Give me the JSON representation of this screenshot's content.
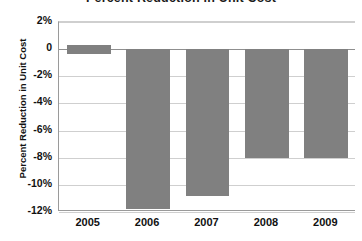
{
  "chart_data": {
    "type": "bar",
    "title": "Percent Reduction in Unit Cost",
    "xlabel": "",
    "ylabel": "Percent Reduction in Unit Cost",
    "categories": [
      "2005",
      "2006",
      "2007",
      "2008",
      "2009"
    ],
    "values": [
      0,
      -11.8,
      -10.8,
      -8.0,
      -8.0
    ],
    "ylim": [
      -12,
      2
    ],
    "ytick_labels": [
      "2%",
      "0",
      "-2%",
      "-4%",
      "-6%",
      "-8%",
      "-10%",
      "-12%"
    ],
    "ytick_values": [
      2,
      0,
      -2,
      -4,
      -6,
      -8,
      -10,
      -12
    ],
    "grid": true,
    "legend": "none",
    "bar_color": "#808080",
    "gridline_color": "#cfcfcf",
    "axis_color": "#9a9a9a",
    "background_color": "#ffffff"
  }
}
